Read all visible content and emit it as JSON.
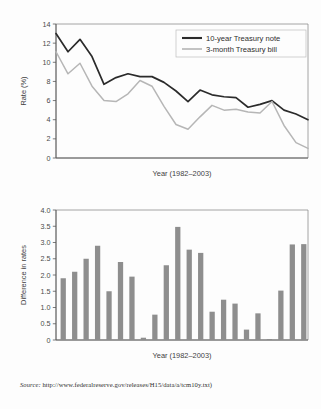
{
  "figure": {
    "source_prefix": "Source:",
    "source_url": "http://www.federalreserve.gov/releases/H15/data/a/tcm10y.txt)"
  },
  "chart_data": [
    {
      "type": "line",
      "title": "",
      "xlabel": "Year (1982–2003)",
      "ylabel": "Rate (%)",
      "ylim": [
        0,
        14
      ],
      "xlim": [
        1982,
        2003
      ],
      "yticks": [
        "0",
        "2",
        "4",
        "6",
        "8",
        "10",
        "12",
        "14"
      ],
      "ytick_values": [
        0,
        2,
        4,
        6,
        8,
        10,
        12,
        14
      ],
      "grid": false,
      "legend_position": "top-right",
      "x": [
        1982,
        1983,
        1984,
        1985,
        1986,
        1987,
        1988,
        1989,
        1990,
        1991,
        1992,
        1993,
        1994,
        1995,
        1996,
        1997,
        1998,
        1999,
        2000,
        2001,
        2002,
        2003
      ],
      "series": [
        {
          "name": "10-year Treasury note",
          "color": "#2b2b2b",
          "values": [
            13.0,
            11.1,
            12.4,
            10.6,
            7.7,
            8.4,
            8.8,
            8.5,
            8.5,
            7.9,
            7.0,
            5.9,
            7.1,
            6.6,
            6.4,
            6.3,
            5.3,
            5.6,
            6.0,
            5.0,
            4.6,
            4.0
          ]
        },
        {
          "name": "3-month Treasury bill",
          "color": "#b6b6b6",
          "values": [
            11.1,
            8.8,
            9.9,
            7.5,
            6.0,
            5.9,
            6.7,
            8.1,
            7.5,
            5.4,
            3.5,
            3.0,
            4.3,
            5.5,
            5.0,
            5.1,
            4.8,
            4.7,
            5.9,
            3.4,
            1.6,
            1.0
          ]
        }
      ]
    },
    {
      "type": "bar",
      "title": "",
      "xlabel": "Year (1982–2003)",
      "ylabel": "Difference in rates",
      "ylim": [
        0,
        4.0
      ],
      "yticks": [
        "0",
        "0.5",
        "1.0",
        "1.5",
        "2.0",
        "2.5",
        "3.0",
        "3.5",
        "4.0"
      ],
      "ytick_values": [
        0,
        0.5,
        1.0,
        1.5,
        2.0,
        2.5,
        3.0,
        3.5,
        4.0
      ],
      "grid": false,
      "bar_color": "#8e8e8e",
      "categories": [
        1982,
        1983,
        1984,
        1985,
        1986,
        1987,
        1988,
        1989,
        1990,
        1991,
        1992,
        1993,
        1994,
        1995,
        1996,
        1997,
        1998,
        1999,
        2000,
        2001,
        2002,
        2003
      ],
      "values": [
        1.9,
        2.1,
        2.5,
        2.9,
        1.5,
        2.4,
        1.95,
        0.07,
        0.78,
        2.3,
        3.48,
        2.78,
        2.68,
        0.87,
        1.24,
        1.12,
        0.32,
        0.82,
        0.03,
        1.52,
        2.94,
        2.95
      ]
    }
  ]
}
